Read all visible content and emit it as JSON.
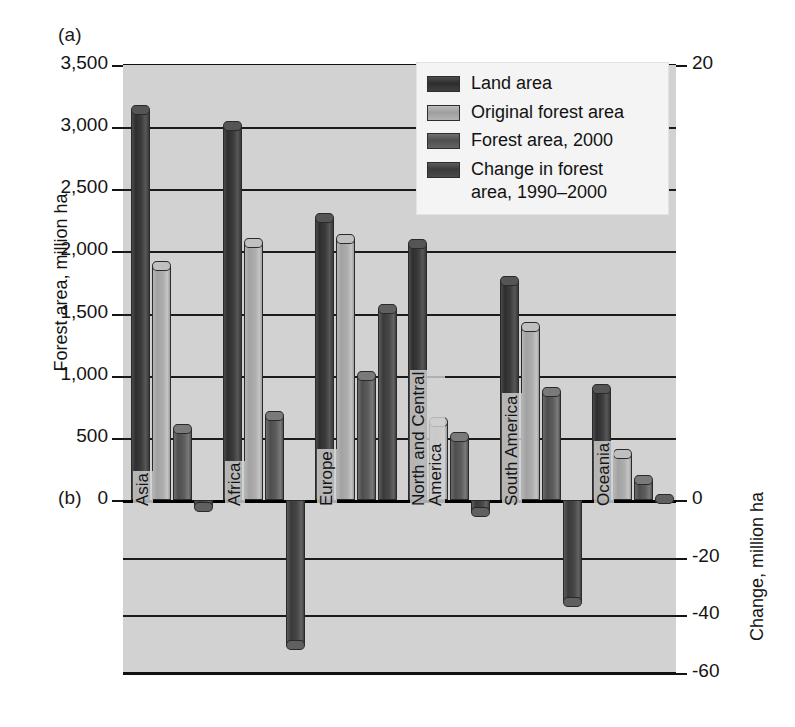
{
  "panels": {
    "a_label": "(a)",
    "b_label": "(b)"
  },
  "axes": {
    "left": {
      "title": "Forest area, million ha",
      "ticks": [
        "3,500",
        "3,000",
        "2,500",
        "2,000",
        "1,500",
        "1,000",
        "500",
        "0"
      ],
      "min": 0,
      "max": 3500
    },
    "right": {
      "title": "Change, million ha",
      "ticks": [
        "20",
        "0",
        "-20",
        "-40",
        "-60"
      ],
      "min": -60,
      "max": 20
    }
  },
  "legend": {
    "items": [
      {
        "label": "Land area",
        "swatch": "k0"
      },
      {
        "label": "Original forest area",
        "swatch": "k1"
      },
      {
        "label": "Forest area, 2000",
        "swatch": "k2"
      },
      {
        "label": "Change in forest\narea, 1990–2000",
        "swatch": "k3"
      }
    ]
  },
  "chart_data": {
    "type": "bar",
    "title": "",
    "xlabel": "",
    "ylabel": "Forest area, million ha",
    "ylabel_secondary": "Change, million ha",
    "ylim": [
      0,
      3500
    ],
    "ylim_secondary": [
      -60,
      20
    ],
    "grid": true,
    "legend_position": "top-right-inside",
    "categories": [
      "Asia",
      "Africa",
      "Europe",
      "North and Central\nAmerica",
      "South America",
      "Oceania"
    ],
    "series": [
      {
        "name": "Land area",
        "axis": "left",
        "values": [
          3180,
          3050,
          2310,
          2100,
          1800,
          930
        ]
      },
      {
        "name": "Original forest area",
        "axis": "left",
        "values": [
          1920,
          2110,
          2140,
          670,
          1430,
          410
        ]
      },
      {
        "name": "Forest area, 2000",
        "axis": "left",
        "values": [
          610,
          720,
          1040,
          550,
          910,
          200
        ]
      },
      {
        "name": "Change in forest area, 1990–2000",
        "axis": "right",
        "values": [
          -4,
          -52,
          9,
          -6,
          -37,
          -1
        ]
      }
    ]
  }
}
